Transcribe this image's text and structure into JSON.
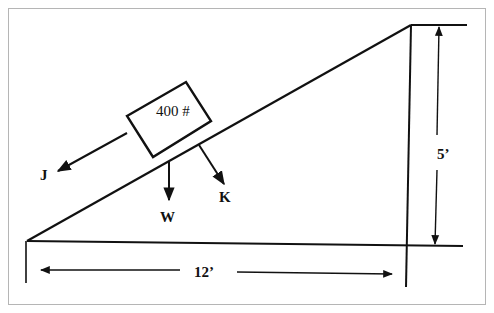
{
  "diagram": {
    "block": {
      "label": "400 #"
    },
    "forces": [
      {
        "id": "J",
        "label": "J",
        "direction": "down-slope (parallel to incline)"
      },
      {
        "id": "W",
        "label": "W",
        "direction": "vertical downward"
      },
      {
        "id": "K",
        "label": "K",
        "direction": "perpendicular into incline"
      }
    ],
    "dimensions": {
      "horizontal": {
        "label": "12’"
      },
      "vertical": {
        "label": "5’"
      }
    },
    "colors": {
      "line": "#111111",
      "frame": "#b5b5b5",
      "background": "#ffffff"
    }
  }
}
